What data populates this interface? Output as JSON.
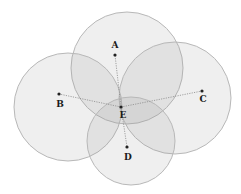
{
  "diagram": {
    "type": "overlapping-circles",
    "hub": "E",
    "points": [
      {
        "id": "A",
        "label": "A"
      },
      {
        "id": "B",
        "label": "B"
      },
      {
        "id": "C",
        "label": "C"
      },
      {
        "id": "D",
        "label": "D"
      },
      {
        "id": "E",
        "label": "E"
      }
    ],
    "circles": [
      "A",
      "B",
      "C",
      "D"
    ],
    "connections": [
      [
        "E",
        "A"
      ],
      [
        "E",
        "B"
      ],
      [
        "E",
        "C"
      ],
      [
        "E",
        "D"
      ]
    ],
    "colors": {
      "circle_fill": "#9a9a9a",
      "circle_stroke": "#b8b8b8",
      "point": "#222222"
    }
  }
}
